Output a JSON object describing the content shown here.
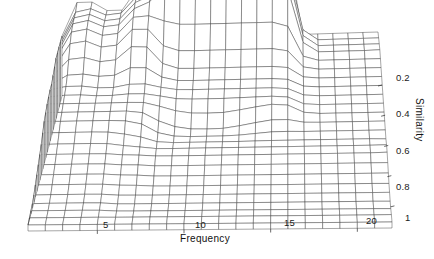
{
  "figure": {
    "type": "surface-plot",
    "background_color": "#ffffff",
    "mesh_color": "#2b2b2b",
    "width": 434,
    "height": 259
  },
  "axes": {
    "x": {
      "name": "frequency-axis",
      "title": "Frequency",
      "ticks": [
        {
          "value": 5,
          "label": "5",
          "px": 106,
          "py": 236
        },
        {
          "value": 10,
          "label": "10",
          "px": 200,
          "py": 235
        },
        {
          "value": 15,
          "label": "15",
          "px": 289,
          "py": 232
        },
        {
          "value": 20,
          "label": "20",
          "px": 371,
          "py": 230
        }
      ],
      "title_px": 178,
      "title_py": 247,
      "range": [
        1,
        22
      ]
    },
    "y": {
      "name": "similarity-axis",
      "title": "Similarity",
      "ticks": [
        {
          "value": 0.2,
          "label": "0.2",
          "px": 403,
          "py": 78
        },
        {
          "value": 0.4,
          "label": "0.4",
          "px": 403,
          "py": 113
        },
        {
          "value": 0.6,
          "label": "0.6",
          "px": 403,
          "py": 150
        },
        {
          "value": 0.8,
          "label": "0.8",
          "px": 403,
          "py": 186
        },
        {
          "value": 1,
          "label": "1",
          "px": 409,
          "py": 218
        }
      ],
      "title_px": 427,
      "title_py": 103,
      "range": [
        0.1,
        1.0
      ]
    },
    "z": {
      "name": "height-axis",
      "title": "",
      "range": [
        0,
        1
      ]
    }
  },
  "chart_data": {
    "type": "surface",
    "title": "",
    "xlabel": "Frequency",
    "ylabel": "Similarity",
    "zlabel": "",
    "grid": true,
    "legend": "none",
    "xlim": [
      1,
      22
    ],
    "ylim": [
      1.0,
      0.1
    ],
    "zlim": [
      0,
      1
    ],
    "x_tick_labels": [
      "5",
      "10",
      "15",
      "20"
    ],
    "x_tick_values": [
      5,
      10,
      15,
      20
    ],
    "y_tick_labels": [
      "0.2",
      "0.4",
      "0.6",
      "0.8",
      "1"
    ],
    "y_tick_values": [
      0.2,
      0.4,
      0.6,
      0.8,
      1
    ],
    "x": [
      1,
      2,
      3,
      4,
      5,
      6,
      7,
      8,
      9,
      10,
      11,
      12,
      13,
      14,
      15,
      16,
      17,
      18,
      19,
      20,
      21,
      22
    ],
    "y": [
      1.0,
      0.96,
      0.92,
      0.88,
      0.84,
      0.8,
      0.76,
      0.72,
      0.68,
      0.64,
      0.6,
      0.56,
      0.52,
      0.48,
      0.44,
      0.4,
      0.36,
      0.32,
      0.28,
      0.24,
      0.2,
      0.16,
      0.12,
      0.1
    ],
    "terraces": [
      {
        "name": "base",
        "z": 0.02,
        "x_from": 1,
        "x_to": 22,
        "y_from": 1.0,
        "y_to": 0.1
      },
      {
        "name": "broad-shelf",
        "z": 0.16,
        "x_from": 1,
        "x_to": 22,
        "y_from": 0.62,
        "y_to": 0.1
      },
      {
        "name": "mid-shelf-left",
        "z": 0.3,
        "x_from": 1,
        "x_to": 8,
        "y_from": 0.52,
        "y_to": 0.1
      },
      {
        "name": "mid-shelf-center",
        "z": 0.34,
        "x_from": 8,
        "x_to": 17,
        "y_from": 0.48,
        "y_to": 0.1
      },
      {
        "name": "right-shelf",
        "z": 0.3,
        "x_from": 17,
        "x_to": 22,
        "y_from": 0.3,
        "y_to": 0.1
      },
      {
        "name": "peak-left-a",
        "z": 0.58,
        "x_from": 2,
        "x_to": 4,
        "y_from": 0.36,
        "y_to": 0.1
      },
      {
        "name": "peak-left-b",
        "z": 0.52,
        "x_from": 4,
        "x_to": 6,
        "y_from": 0.32,
        "y_to": 0.1
      },
      {
        "name": "peak-mid",
        "z": 0.64,
        "x_from": 6,
        "x_to": 8,
        "y_from": 0.3,
        "y_to": 0.1
      },
      {
        "name": "peak-main",
        "z": 0.86,
        "x_from": 8,
        "x_to": 17,
        "y_from": 0.26,
        "y_to": 0.1
      },
      {
        "name": "ridge-far-left",
        "z": 0.4,
        "x_from": 1,
        "x_to": 2,
        "y_from": 0.8,
        "y_to": 0.4
      }
    ],
    "z_matrix_note": "Rows correspond to y (similarity, back=0.1 .. front=1.0); columns to x (frequency 1..22). Values are normalized surface heights 0..1.",
    "z_matrix": [
      [
        0.4,
        0.62,
        0.62,
        0.56,
        0.56,
        0.7,
        0.7,
        0.92,
        0.92,
        0.92,
        0.92,
        0.92,
        0.92,
        0.92,
        0.92,
        0.92,
        0.36,
        0.36,
        0.36,
        0.36,
        0.36,
        0.36
      ],
      [
        0.4,
        0.62,
        0.62,
        0.56,
        0.56,
        0.7,
        0.7,
        0.92,
        0.92,
        0.92,
        0.92,
        0.92,
        0.92,
        0.92,
        0.92,
        0.92,
        0.36,
        0.36,
        0.36,
        0.36,
        0.36,
        0.36
      ],
      [
        0.4,
        0.62,
        0.62,
        0.56,
        0.56,
        0.7,
        0.7,
        0.92,
        0.92,
        0.92,
        0.92,
        0.92,
        0.92,
        0.92,
        0.92,
        0.92,
        0.36,
        0.36,
        0.36,
        0.36,
        0.36,
        0.36
      ],
      [
        0.4,
        0.62,
        0.62,
        0.56,
        0.56,
        0.7,
        0.7,
        0.9,
        0.88,
        0.88,
        0.88,
        0.88,
        0.88,
        0.88,
        0.88,
        0.88,
        0.36,
        0.36,
        0.36,
        0.36,
        0.36,
        0.36
      ],
      [
        0.4,
        0.6,
        0.6,
        0.54,
        0.54,
        0.68,
        0.68,
        0.6,
        0.58,
        0.58,
        0.58,
        0.58,
        0.58,
        0.58,
        0.58,
        0.58,
        0.34,
        0.34,
        0.34,
        0.34,
        0.34,
        0.34
      ],
      [
        0.38,
        0.56,
        0.56,
        0.5,
        0.5,
        0.64,
        0.64,
        0.48,
        0.46,
        0.46,
        0.46,
        0.46,
        0.46,
        0.46,
        0.46,
        0.46,
        0.32,
        0.32,
        0.32,
        0.32,
        0.32,
        0.32
      ],
      [
        0.36,
        0.48,
        0.48,
        0.44,
        0.44,
        0.56,
        0.56,
        0.4,
        0.38,
        0.38,
        0.38,
        0.38,
        0.38,
        0.38,
        0.38,
        0.38,
        0.3,
        0.3,
        0.3,
        0.3,
        0.3,
        0.3
      ],
      [
        0.34,
        0.4,
        0.4,
        0.38,
        0.38,
        0.44,
        0.44,
        0.36,
        0.34,
        0.34,
        0.34,
        0.34,
        0.34,
        0.34,
        0.34,
        0.34,
        0.28,
        0.28,
        0.28,
        0.28,
        0.28,
        0.28
      ],
      [
        0.34,
        0.36,
        0.36,
        0.34,
        0.34,
        0.36,
        0.36,
        0.34,
        0.32,
        0.32,
        0.32,
        0.32,
        0.32,
        0.32,
        0.32,
        0.32,
        0.26,
        0.26,
        0.26,
        0.26,
        0.26,
        0.26
      ],
      [
        0.33,
        0.34,
        0.34,
        0.33,
        0.33,
        0.34,
        0.34,
        0.32,
        0.3,
        0.3,
        0.3,
        0.3,
        0.3,
        0.3,
        0.3,
        0.3,
        0.24,
        0.24,
        0.24,
        0.24,
        0.24,
        0.24
      ],
      [
        0.32,
        0.32,
        0.32,
        0.32,
        0.32,
        0.32,
        0.32,
        0.3,
        0.26,
        0.24,
        0.24,
        0.24,
        0.26,
        0.28,
        0.3,
        0.3,
        0.22,
        0.22,
        0.22,
        0.22,
        0.22,
        0.22
      ],
      [
        0.3,
        0.3,
        0.3,
        0.3,
        0.3,
        0.3,
        0.3,
        0.22,
        0.18,
        0.16,
        0.16,
        0.16,
        0.18,
        0.2,
        0.22,
        0.22,
        0.2,
        0.2,
        0.2,
        0.2,
        0.2,
        0.2
      ],
      [
        0.28,
        0.28,
        0.28,
        0.28,
        0.28,
        0.28,
        0.26,
        0.18,
        0.16,
        0.16,
        0.16,
        0.16,
        0.16,
        0.17,
        0.18,
        0.18,
        0.18,
        0.18,
        0.18,
        0.18,
        0.18,
        0.18
      ],
      [
        0.24,
        0.24,
        0.24,
        0.24,
        0.24,
        0.22,
        0.2,
        0.16,
        0.16,
        0.16,
        0.16,
        0.16,
        0.16,
        0.16,
        0.16,
        0.16,
        0.16,
        0.16,
        0.16,
        0.16,
        0.16,
        0.16
      ],
      [
        0.2,
        0.2,
        0.2,
        0.2,
        0.2,
        0.18,
        0.17,
        0.16,
        0.16,
        0.16,
        0.16,
        0.16,
        0.16,
        0.16,
        0.16,
        0.16,
        0.16,
        0.16,
        0.16,
        0.16,
        0.16,
        0.16
      ],
      [
        0.17,
        0.17,
        0.17,
        0.17,
        0.17,
        0.16,
        0.16,
        0.15,
        0.15,
        0.15,
        0.15,
        0.15,
        0.15,
        0.15,
        0.15,
        0.15,
        0.15,
        0.15,
        0.15,
        0.15,
        0.15,
        0.15
      ],
      [
        0.14,
        0.14,
        0.14,
        0.14,
        0.14,
        0.13,
        0.13,
        0.12,
        0.12,
        0.12,
        0.12,
        0.12,
        0.12,
        0.12,
        0.12,
        0.12,
        0.12,
        0.12,
        0.12,
        0.12,
        0.12,
        0.12
      ],
      [
        0.11,
        0.11,
        0.11,
        0.11,
        0.11,
        0.1,
        0.1,
        0.09,
        0.09,
        0.09,
        0.09,
        0.09,
        0.09,
        0.09,
        0.09,
        0.09,
        0.09,
        0.09,
        0.09,
        0.09,
        0.09,
        0.09
      ],
      [
        0.08,
        0.08,
        0.08,
        0.08,
        0.08,
        0.07,
        0.07,
        0.06,
        0.06,
        0.06,
        0.06,
        0.06,
        0.06,
        0.06,
        0.06,
        0.06,
        0.06,
        0.06,
        0.06,
        0.06,
        0.06,
        0.06
      ],
      [
        0.05,
        0.05,
        0.05,
        0.05,
        0.05,
        0.04,
        0.04,
        0.04,
        0.04,
        0.04,
        0.04,
        0.04,
        0.04,
        0.04,
        0.04,
        0.04,
        0.04,
        0.04,
        0.04,
        0.04,
        0.04,
        0.04
      ],
      [
        0.03,
        0.03,
        0.03,
        0.03,
        0.03,
        0.02,
        0.02,
        0.02,
        0.02,
        0.02,
        0.02,
        0.02,
        0.02,
        0.02,
        0.02,
        0.02,
        0.02,
        0.02,
        0.02,
        0.02,
        0.02,
        0.02
      ],
      [
        0.02,
        0.02,
        0.02,
        0.02,
        0.02,
        0.01,
        0.01,
        0.01,
        0.01,
        0.01,
        0.01,
        0.01,
        0.01,
        0.01,
        0.01,
        0.01,
        0.01,
        0.01,
        0.01,
        0.01,
        0.01,
        0.01
      ],
      [
        0.01,
        0.01,
        0.01,
        0.01,
        0.01,
        0.01,
        0.01,
        0.01,
        0.01,
        0.01,
        0.01,
        0.01,
        0.01,
        0.01,
        0.01,
        0.01,
        0.01,
        0.01,
        0.01,
        0.01,
        0.01,
        0.01
      ],
      [
        0.0,
        0.0,
        0.0,
        0.0,
        0.0,
        0.0,
        0.0,
        0.0,
        0.0,
        0.0,
        0.0,
        0.0,
        0.0,
        0.0,
        0.0,
        0.0,
        0.0,
        0.0,
        0.0,
        0.0,
        0.0,
        0.0
      ]
    ]
  },
  "projection": {
    "origin_front_left": [
      28,
      225
    ],
    "origin_front_right": [
      392,
      222
    ],
    "origin_back_left": [
      62,
      96
    ],
    "origin_back_right": [
      378,
      86
    ],
    "z_scale": 150
  }
}
